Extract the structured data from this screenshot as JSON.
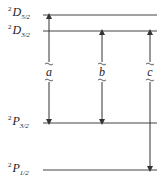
{
  "levels": [
    {
      "id": "D52",
      "sup": "2",
      "term": "D",
      "sub": "5/2",
      "y": 15
    },
    {
      "id": "D32",
      "sup": "2",
      "term": "D",
      "sub": "3/2",
      "y": 31
    },
    {
      "id": "P32",
      "sup": "2",
      "term": "P",
      "sub": "3/2",
      "y": 123
    },
    {
      "id": "P12",
      "sup": "2",
      "term": "P",
      "sub": "1/2",
      "y": 170
    }
  ],
  "transitions": [
    {
      "label": "a",
      "from": "²P₃/₂",
      "to": "²D₅/₂",
      "x": 49
    },
    {
      "label": "b",
      "from": "²P₃/₂",
      "to": "²D₃/₂",
      "x": 102
    },
    {
      "label": "c",
      "from": "²P₁/₂",
      "to": "²D₃/₂",
      "x": 150
    }
  ],
  "colors": {
    "line": "#333333"
  }
}
